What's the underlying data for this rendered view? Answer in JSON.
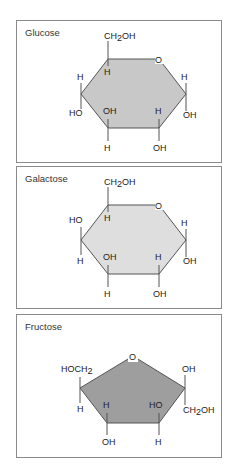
{
  "panels": [
    {
      "title": "Glucose",
      "ring": "pyranose",
      "fill": "#c8c8c8",
      "labels": {
        "top": "CH2OH",
        "ring_o": "O",
        "c1_up": "H",
        "c1_down": "OH",
        "c2_up": "H",
        "c2_down": "OH",
        "c3_up": "OH",
        "c3_down": "H",
        "c4_up": "H",
        "c4_down": "HO",
        "c5_down": "H"
      }
    },
    {
      "title": "Galactose",
      "ring": "pyranose",
      "fill": "#dedede",
      "labels": {
        "top": "CH2OH",
        "ring_o": "O",
        "c1_up": "H",
        "c1_down": "OH",
        "c2_up": "H",
        "c2_down": "OH",
        "c3_up": "OH",
        "c3_down": "H",
        "c4_up": "HO",
        "c4_down": "H",
        "c5_down": "H"
      }
    },
    {
      "title": "Fructose",
      "ring": "furanose",
      "fill": "#9e9e9e",
      "labels": {
        "ring_o": "O",
        "left_up": "HOCH2",
        "left_down": "H",
        "c2_up": "OH",
        "c2_down": "CH2OH",
        "c3_up": "HO",
        "c3_down": "H",
        "c4_up": "H",
        "c4_down": "OH"
      }
    }
  ]
}
